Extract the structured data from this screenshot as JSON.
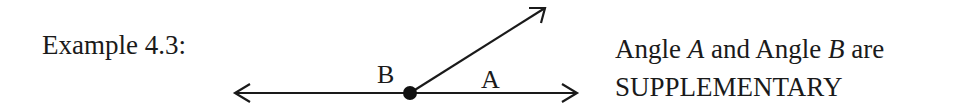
{
  "example": {
    "label": "Example 4.3:"
  },
  "diagram": {
    "vertex": {
      "x": 410,
      "y": 93,
      "label": "vertex"
    },
    "line": {
      "x1": 234,
      "x2": 578,
      "y": 93
    },
    "ray": {
      "x2": 546,
      "y2": 7
    },
    "labels": {
      "B": "B",
      "A": "A"
    },
    "stroke_color": "#1a1a1a"
  },
  "caption": {
    "line1": {
      "word1": "Angle",
      "var1": "A",
      "word2": "and Angle",
      "var2": "B",
      "word3": "are"
    },
    "line2": "SUPPLEMENTARY"
  }
}
